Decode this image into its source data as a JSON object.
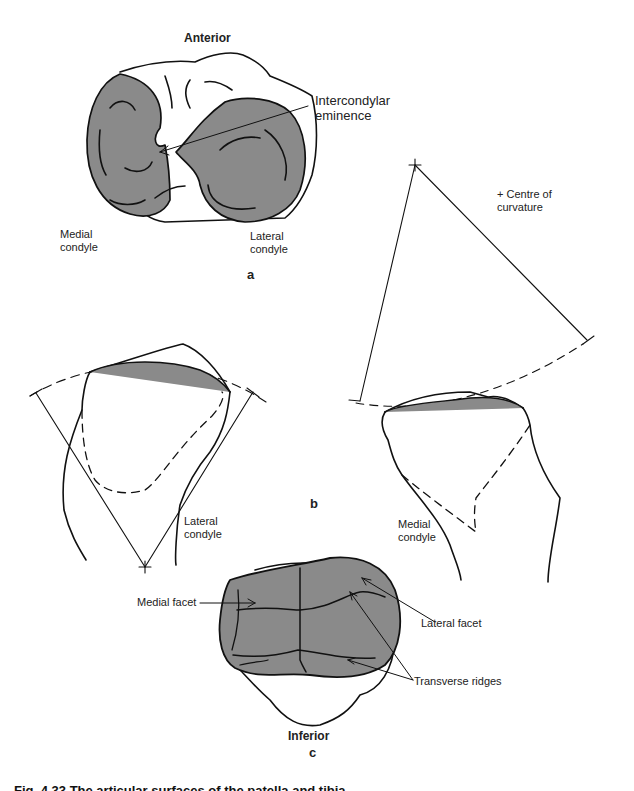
{
  "figure": {
    "panels": {
      "a": {
        "panel_label": "a",
        "title": "Anterior",
        "labels": {
          "intercondylar": "Intercondylar\neminence",
          "medial_condyle": "Medial\ncondyle",
          "lateral_condyle": "Lateral\ncondyle"
        }
      },
      "b": {
        "panel_label": "b",
        "labels": {
          "centre_of_curvature": "+ Centre of\ncurvature",
          "lateral_condyle": "Lateral\ncondyle",
          "medial_condyle": "Medial\ncondyle"
        }
      },
      "c": {
        "panel_label": "c",
        "title": "Inferior",
        "labels": {
          "medial_facet": "Medial facet",
          "lateral_facet": "Lateral facet",
          "transverse_ridges": "Transverse ridges"
        }
      }
    },
    "caption": "Fig. 4.33  The articular surfaces of the patella and tibia"
  },
  "colors": {
    "line": "#111111",
    "shade": "#8a8a8a",
    "background": "#ffffff"
  }
}
